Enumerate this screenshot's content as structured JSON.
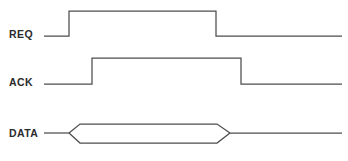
{
  "diagram": {
    "kind": "timing-diagram",
    "width": 348,
    "height": 161,
    "background_color": "#ffffff",
    "line_color": "#4d4d4d",
    "label_color": "#2b2b2b"
  },
  "signals": [
    {
      "name": "REQ",
      "label": "REQ",
      "label_x": 9,
      "label_y": 35,
      "low_y": 36,
      "high_y": 11,
      "start_x": 44,
      "end_x": 342,
      "rise_x": 69,
      "fall_x": 216,
      "path": "M 44 36 L 69 36 L 69 11 L 216 11 L 216 36 L 342 36"
    },
    {
      "name": "ACK",
      "label": "ACK",
      "label_x": 9,
      "label_y": 83,
      "low_y": 84,
      "high_y": 58,
      "start_x": 44,
      "end_x": 342,
      "rise_x": 92,
      "fall_x": 241,
      "path": "M 44 84 L 92 84 L 92 58 L 241 58 L 241 84 L 342 84"
    },
    {
      "name": "DATA",
      "label": "DATA",
      "label_x": 9,
      "label_y": 134,
      "mid_y": 133,
      "top_y": 124,
      "bottom_y": 143,
      "start_x": 44,
      "end_x": 342,
      "open_x": 69,
      "valid_start_x": 80,
      "valid_end_x": 217,
      "close_x": 230,
      "path_lead": "M 44 133 L 69 133",
      "path_upper": "M 69 133 L 80 124 L 217 124 L 230 133",
      "path_lower": "M 69 133 L 80 143 L 217 143 L 230 133",
      "path_tail": "M 230 133 L 342 133"
    }
  ],
  "chart_data": {
    "type": "line",
    "xlabel": "",
    "ylabel": "",
    "xlim": [
      44,
      342
    ],
    "grid": false,
    "legend": "none",
    "series": [
      {
        "name": "REQ",
        "kind": "digital",
        "transitions": [
          {
            "x": 44,
            "level": "low"
          },
          {
            "x": 69,
            "level": "high"
          },
          {
            "x": 216,
            "level": "low"
          },
          {
            "x": 342,
            "level": "low"
          }
        ]
      },
      {
        "name": "ACK",
        "kind": "digital",
        "transitions": [
          {
            "x": 44,
            "level": "low"
          },
          {
            "x": 92,
            "level": "high"
          },
          {
            "x": 241,
            "level": "low"
          },
          {
            "x": 342,
            "level": "low"
          }
        ]
      },
      {
        "name": "DATA",
        "kind": "bus",
        "transitions": [
          {
            "x": 44,
            "level": "idle"
          },
          {
            "x": 69,
            "level": "transition-open"
          },
          {
            "x": 80,
            "level": "valid"
          },
          {
            "x": 217,
            "level": "transition-close"
          },
          {
            "x": 230,
            "level": "idle"
          },
          {
            "x": 342,
            "level": "idle"
          }
        ]
      }
    ]
  }
}
